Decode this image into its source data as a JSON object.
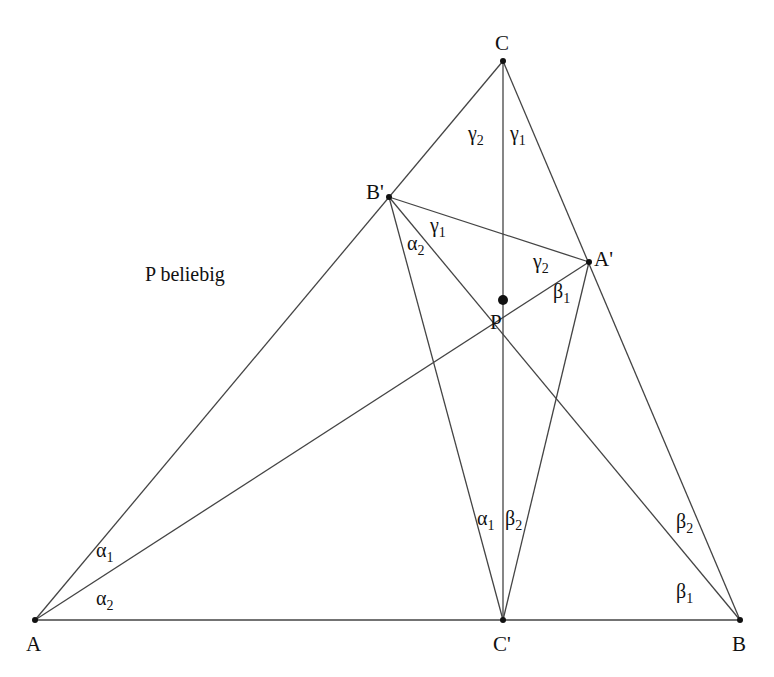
{
  "diagram": {
    "note": "P beliebig",
    "points": {
      "A": {
        "label": "A",
        "x": 35,
        "y": 620
      },
      "B": {
        "label": "B",
        "x": 740,
        "y": 620
      },
      "C": {
        "label": "C",
        "x": 503,
        "y": 61
      },
      "C_prime": {
        "label": "C'",
        "x": 503,
        "y": 620
      },
      "B_prime": {
        "label": "B'",
        "x": 389,
        "y": 197
      },
      "A_prime": {
        "label": "A'",
        "x": 589,
        "y": 262
      },
      "P": {
        "label": "P",
        "x": 503,
        "y": 300
      }
    },
    "angles": {
      "gamma2_top": {
        "sym": "γ",
        "sub": "2"
      },
      "gamma1_top": {
        "sym": "γ",
        "sub": "1"
      },
      "gamma1_bp": {
        "sym": "γ",
        "sub": "1"
      },
      "alpha2_bp": {
        "sym": "α",
        "sub": "2"
      },
      "gamma2_ap": {
        "sym": "γ",
        "sub": "2"
      },
      "beta1_ap": {
        "sym": "β",
        "sub": "1"
      },
      "alpha1_cp": {
        "sym": "α",
        "sub": "1"
      },
      "beta2_cp": {
        "sym": "β",
        "sub": "2"
      },
      "alpha1_a": {
        "sym": "α",
        "sub": "1"
      },
      "alpha2_a": {
        "sym": "α",
        "sub": "2"
      },
      "beta2_b": {
        "sym": "β",
        "sub": "2"
      },
      "beta1_b": {
        "sym": "β",
        "sub": "1"
      }
    }
  }
}
